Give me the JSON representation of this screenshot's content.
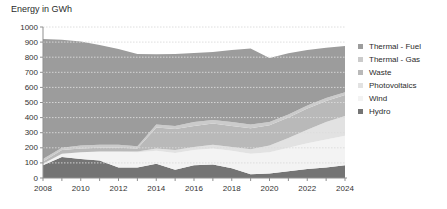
{
  "chart_data": {
    "type": "area",
    "title": "Energy in GWh",
    "xlabel": "",
    "ylabel": "Energy in GWh",
    "ylim": [
      0,
      1000
    ],
    "y_step": 100,
    "x_label_step": 2,
    "grid": true,
    "legend_position": "right",
    "stacked": true,
    "x": [
      2008,
      2009,
      2010,
      2011,
      2012,
      2013,
      2014,
      2015,
      2016,
      2017,
      2018,
      2019,
      2020,
      2021,
      2022,
      2023,
      2024
    ],
    "x_tick_labels": [
      "2008",
      "2010",
      "2012",
      "2014",
      "2016",
      "2018",
      "2020",
      "2022",
      "2024"
    ],
    "y_tick_labels": [
      "0",
      "100",
      "200",
      "300",
      "400",
      "500",
      "600",
      "700",
      "800",
      "900",
      "1000"
    ],
    "series": [
      {
        "name": "Hydro",
        "color": "#747474",
        "values": [
          85,
          140,
          125,
          115,
          70,
          70,
          95,
          55,
          85,
          90,
          65,
          25,
          30,
          45,
          60,
          70,
          85
        ]
      },
      {
        "name": "Wind",
        "color": "#f3f3f3",
        "values": [
          10,
          20,
          45,
          60,
          105,
          100,
          85,
          110,
          100,
          105,
          115,
          135,
          140,
          155,
          170,
          185,
          195
        ]
      },
      {
        "name": "Photovoltaics",
        "color": "#e2e2e2",
        "values": [
          0,
          0,
          0,
          0,
          0,
          5,
          15,
          20,
          20,
          25,
          25,
          30,
          45,
          65,
          90,
          115,
          130
        ]
      },
      {
        "name": "Waste",
        "color": "#b9b9b9",
        "values": [
          15,
          25,
          25,
          25,
          25,
          20,
          140,
          140,
          140,
          140,
          140,
          140,
          135,
          135,
          140,
          140,
          140
        ]
      },
      {
        "name": "Thermal - Gas",
        "color": "#cbcbcb",
        "values": [
          15,
          15,
          20,
          20,
          20,
          15,
          20,
          20,
          25,
          25,
          25,
          25,
          20,
          20,
          20,
          20,
          18
        ]
      },
      {
        "name": "Thermal - Fuel",
        "color": "#9c9c9c",
        "values": [
          795,
          715,
          688,
          660,
          635,
          612,
          465,
          477,
          458,
          450,
          478,
          503,
          425,
          406,
          368,
          332,
          307
        ]
      }
    ],
    "legend_order": [
      "Thermal - Fuel",
      "Thermal - Gas",
      "Waste",
      "Photovoltaics",
      "Wind",
      "Hydro"
    ],
    "colors": {
      "axis": "#8f8f8f",
      "grid": "#dcdcdc",
      "tick_text": "#333333"
    }
  }
}
